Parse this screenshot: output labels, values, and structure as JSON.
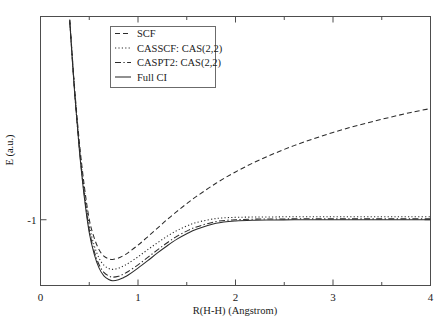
{
  "chart_data": {
    "type": "line",
    "title": "",
    "xlabel": "R(H-H) (Angstrom)",
    "ylabel": "E (a.u.)",
    "xlim": [
      0,
      4
    ],
    "ylim": [
      -1.22,
      -0.32
    ],
    "xticks": [
      0,
      1,
      2,
      3,
      4
    ],
    "xtick_labels": [
      "0",
      "1",
      "2",
      "3",
      "4"
    ],
    "yticks": [
      -1
    ],
    "ytick_labels": [
      "-1"
    ],
    "grid": false,
    "legend_position": "upper left",
    "series": [
      {
        "name": "SCF",
        "linestyle": "dashed",
        "color": "#2b2b2b",
        "x": [
          0.3,
          0.35,
          0.4,
          0.45,
          0.5,
          0.55,
          0.6,
          0.65,
          0.7,
          0.74,
          0.8,
          0.85,
          0.9,
          1.0,
          1.1,
          1.2,
          1.3,
          1.4,
          1.5,
          1.6,
          1.8,
          2.0,
          2.2,
          2.4,
          2.6,
          2.8,
          3.0,
          3.2,
          3.4,
          3.6,
          3.8,
          4.0
        ],
        "y": [
          -0.33,
          -0.56,
          -0.745,
          -0.889,
          -0.999,
          -1.06,
          -1.1,
          -1.122,
          -1.131,
          -1.133,
          -1.128,
          -1.12,
          -1.11,
          -1.085,
          -1.057,
          -1.028,
          -0.999,
          -0.972,
          -0.946,
          -0.922,
          -0.878,
          -0.84,
          -0.807,
          -0.778,
          -0.752,
          -0.729,
          -0.708,
          -0.689,
          -0.672,
          -0.656,
          -0.641,
          -0.628
        ]
      },
      {
        "name": "CASSCF: CAS(2,2)",
        "linestyle": "dotted",
        "color": "#2b2b2b",
        "x": [
          0.3,
          0.35,
          0.4,
          0.45,
          0.5,
          0.55,
          0.6,
          0.65,
          0.7,
          0.74,
          0.8,
          0.85,
          0.9,
          1.0,
          1.1,
          1.2,
          1.3,
          1.4,
          1.5,
          1.6,
          1.8,
          2.0,
          2.2,
          2.4,
          2.6,
          2.8,
          3.0,
          3.2,
          3.4,
          3.6,
          3.8,
          4.0
        ],
        "y": [
          -0.332,
          -0.566,
          -0.756,
          -0.904,
          -1.018,
          -1.085,
          -1.128,
          -1.152,
          -1.163,
          -1.166,
          -1.162,
          -1.155,
          -1.146,
          -1.124,
          -1.1,
          -1.077,
          -1.055,
          -1.036,
          -1.021,
          -1.009,
          -0.996,
          -0.992,
          -0.991,
          -0.9905,
          -0.99,
          -0.99,
          -0.99,
          -0.99,
          -0.99,
          -0.99,
          -0.99,
          -0.99
        ]
      },
      {
        "name": "CASPT2: CAS(2,2)",
        "linestyle": "dashdot",
        "color": "#2b2b2b",
        "x": [
          0.3,
          0.35,
          0.4,
          0.45,
          0.5,
          0.55,
          0.6,
          0.65,
          0.7,
          0.74,
          0.8,
          0.85,
          0.9,
          1.0,
          1.1,
          1.2,
          1.3,
          1.4,
          1.5,
          1.6,
          1.8,
          2.0,
          2.2,
          2.4,
          2.6,
          2.8,
          3.0,
          3.2,
          3.4,
          3.6,
          3.8,
          4.0
        ],
        "y": [
          -0.335,
          -0.572,
          -0.766,
          -0.918,
          -1.034,
          -1.104,
          -1.15,
          -1.176,
          -1.188,
          -1.192,
          -1.189,
          -1.182,
          -1.173,
          -1.151,
          -1.126,
          -1.101,
          -1.077,
          -1.055,
          -1.038,
          -1.024,
          -1.006,
          -1.0,
          -0.998,
          -0.9975,
          -0.997,
          -0.997,
          -0.997,
          -0.997,
          -0.997,
          -0.997,
          -0.997,
          -0.997
        ]
      },
      {
        "name": "Full CI",
        "linestyle": "solid",
        "color": "#2b2b2b",
        "x": [
          0.3,
          0.35,
          0.4,
          0.45,
          0.5,
          0.55,
          0.6,
          0.65,
          0.7,
          0.74,
          0.8,
          0.85,
          0.9,
          1.0,
          1.1,
          1.2,
          1.3,
          1.4,
          1.5,
          1.6,
          1.8,
          2.0,
          2.2,
          2.4,
          2.6,
          2.8,
          3.0,
          3.2,
          3.4,
          3.6,
          3.8,
          4.0
        ],
        "y": [
          -0.337,
          -0.576,
          -0.772,
          -0.926,
          -1.043,
          -1.114,
          -1.161,
          -1.188,
          -1.2,
          -1.204,
          -1.201,
          -1.194,
          -1.185,
          -1.162,
          -1.137,
          -1.111,
          -1.087,
          -1.065,
          -1.047,
          -1.032,
          -1.012,
          -1.004,
          -1.0015,
          -1.001,
          -1.0,
          -1.0,
          -1.0,
          -1.0,
          -1.0,
          -1.0,
          -1.0,
          -1.0
        ]
      }
    ]
  },
  "legend": {
    "entries": [
      {
        "label": "SCF",
        "style": "dashed"
      },
      {
        "label": "CASSCF: CAS(2,2)",
        "style": "dotted"
      },
      {
        "label": "CASPT2: CAS(2,2)",
        "style": "dashdot"
      },
      {
        "label": "Full CI",
        "style": "solid"
      }
    ]
  }
}
